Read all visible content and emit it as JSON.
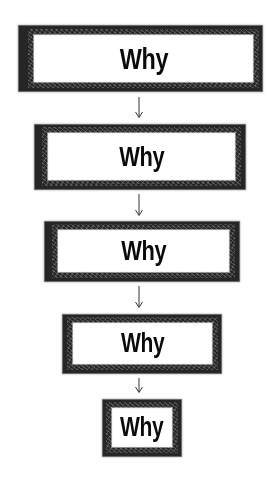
{
  "diagram": {
    "title": "",
    "stroke_color": "#2a2a2a",
    "text_color": "#111111",
    "background": "#ffffff",
    "boxes": [
      {
        "label": "Why",
        "x": 19,
        "y": 26,
        "w": 243,
        "h": 65,
        "font_size": 30,
        "border": [
          8,
          8,
          8,
          14
        ]
      },
      {
        "label": "Why",
        "x": 35,
        "y": 125,
        "w": 210,
        "h": 64,
        "font_size": 28,
        "border": [
          7,
          9,
          8,
          12
        ]
      },
      {
        "label": "Why",
        "x": 45,
        "y": 222,
        "w": 194,
        "h": 59,
        "font_size": 28,
        "border": [
          7,
          9,
          8,
          12
        ]
      },
      {
        "label": "Why",
        "x": 63,
        "y": 315,
        "w": 158,
        "h": 58,
        "font_size": 27,
        "border": [
          7,
          8,
          8,
          9
        ]
      },
      {
        "label": "Why",
        "x": 103,
        "y": 400,
        "w": 78,
        "h": 56,
        "font_size": 27,
        "border": [
          7,
          8,
          8,
          8
        ]
      }
    ],
    "arrows": [
      {
        "from": 0,
        "to": 1,
        "x": 139,
        "y1": 97,
        "y2": 118,
        "glyph": "down-arrow"
      },
      {
        "from": 1,
        "to": 2,
        "x": 139,
        "y1": 194,
        "y2": 216,
        "glyph": "down-arrow"
      },
      {
        "from": 2,
        "to": 3,
        "x": 139,
        "y1": 286,
        "y2": 308,
        "glyph": "down-arrow"
      },
      {
        "from": 3,
        "to": 4,
        "x": 139,
        "y1": 378,
        "y2": 393,
        "glyph": "down-arrow"
      }
    ]
  }
}
